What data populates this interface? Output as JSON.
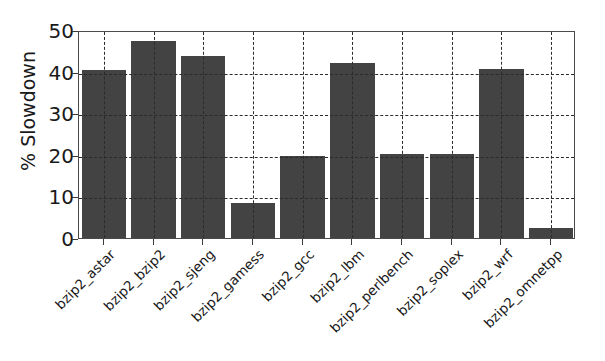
{
  "chart_data": {
    "type": "bar",
    "title": "",
    "xlabel": "",
    "ylabel": "% Slowdown",
    "ylim": [
      0,
      50
    ],
    "yticks": [
      0,
      10,
      20,
      30,
      40,
      50
    ],
    "ytick_labels": [
      "0",
      "10",
      "20",
      "30",
      "40",
      "50"
    ],
    "grid": true,
    "grid_style": "dashed",
    "legend": "none",
    "bar_color": "#434343",
    "categories": [
      "bzip2_astar",
      "bzip2_bzip2",
      "bzip2_sjeng",
      "bzip2_gamess",
      "bzip2_gcc",
      "bzip2_lbm",
      "bzip2_perlbench",
      "bzip2_soplex",
      "bzip2_wrf",
      "bzip2_omnetpp"
    ],
    "values": [
      40.5,
      47.3,
      43.7,
      8.5,
      19.7,
      42.0,
      20.2,
      20.3,
      40.7,
      2.5
    ]
  }
}
